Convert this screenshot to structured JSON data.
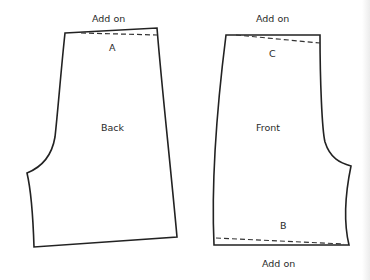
{
  "diagram": {
    "type": "sewing-pattern",
    "pieces": [
      {
        "name": "Back",
        "labels": {
          "top_annotation": "Add on",
          "marker": "A",
          "piece": "Back"
        }
      },
      {
        "name": "Front",
        "labels": {
          "top_annotation": "Add on",
          "top_marker": "C",
          "piece": "Front",
          "bottom_marker": "B",
          "bottom_annotation": "Add on"
        }
      }
    ],
    "colors": {
      "line": "#222222",
      "background": "#ffffff"
    }
  }
}
